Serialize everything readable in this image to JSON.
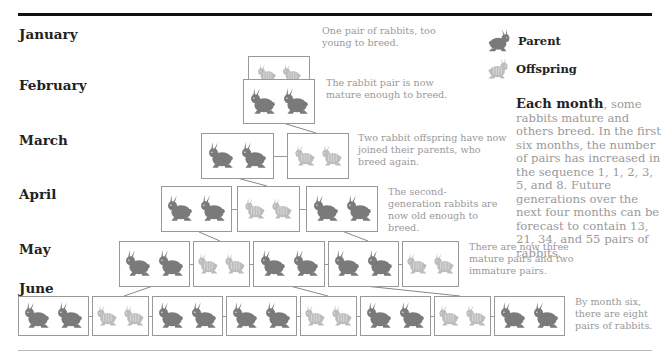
{
  "months": [
    {
      "name": "January",
      "y": 26
    },
    {
      "name": "February",
      "y": 77
    },
    {
      "name": "March",
      "y": 132
    },
    {
      "name": "April",
      "y": 186
    },
    {
      "name": "May",
      "y": 241
    },
    {
      "name": "June",
      "y": 280
    }
  ],
  "rows": [
    {
      "top": 56,
      "h": 36,
      "boxes": [
        {
          "x": 248,
          "w": 62,
          "type": "offspring"
        }
      ]
    },
    {
      "top": 79,
      "h": 45,
      "boxes": [
        {
          "x": 243,
          "w": 72,
          "type": "parent"
        }
      ]
    },
    {
      "top": 133,
      "h": 46,
      "boxes": [
        {
          "x": 201,
          "w": 73,
          "type": "parent"
        },
        {
          "x": 287,
          "w": 62,
          "type": "offspring"
        }
      ]
    },
    {
      "top": 186,
      "h": 46,
      "boxes": [
        {
          "x": 161,
          "w": 71,
          "type": "parent"
        },
        {
          "x": 237,
          "w": 63,
          "type": "offspring"
        },
        {
          "x": 306,
          "w": 72,
          "type": "parent"
        }
      ]
    },
    {
      "top": 241,
      "h": 46,
      "boxes": [
        {
          "x": 119,
          "w": 71,
          "type": "parent"
        },
        {
          "x": 193,
          "w": 57,
          "type": "offspring"
        },
        {
          "x": 253,
          "w": 72,
          "type": "parent"
        },
        {
          "x": 328,
          "w": 71,
          "type": "parent"
        },
        {
          "x": 402,
          "w": 57,
          "type": "offspring"
        }
      ]
    },
    {
      "top": 296,
      "h": 40,
      "boxes": [
        {
          "x": 18,
          "w": 71,
          "type": "parent"
        },
        {
          "x": 92,
          "w": 57,
          "type": "offspring"
        },
        {
          "x": 152,
          "w": 71,
          "type": "parent"
        },
        {
          "x": 226,
          "w": 71,
          "type": "parent"
        },
        {
          "x": 300,
          "w": 57,
          "type": "offspring"
        },
        {
          "x": 360,
          "w": 71,
          "type": "parent"
        },
        {
          "x": 434,
          "w": 57,
          "type": "offspring"
        },
        {
          "x": 494,
          "w": 71,
          "type": "parent"
        }
      ]
    }
  ],
  "links": [
    [
      283,
      123,
      316,
      133
    ],
    [
      237,
      178,
      267,
      186
    ],
    [
      199,
      232,
      220,
      241
    ],
    [
      342,
      231,
      368,
      241
    ],
    [
      153,
      286,
      124,
      296
    ],
    [
      290,
      286,
      328,
      296
    ],
    [
      365,
      286,
      460,
      296
    ]
  ],
  "notes": [
    {
      "x": 322,
      "y": 25,
      "w": 130,
      "text": "One pair of rabbits, too young to breed."
    },
    {
      "x": 326,
      "y": 77,
      "w": 130,
      "text": "The rabbit pair is now mature enough to breed."
    },
    {
      "x": 358,
      "y": 132,
      "w": 150,
      "text": "Two rabbit offspring have now joined their parents, who breed again."
    },
    {
      "x": 388,
      "y": 186,
      "w": 110,
      "text": "The second-generation rabbits are now old enough to breed."
    },
    {
      "x": 469,
      "y": 241,
      "w": 110,
      "text": "There are now three mature pairs and two immature pairs."
    },
    {
      "x": 575,
      "y": 296,
      "w": 90,
      "text": "By month six, there are eight pairs of rabbits."
    }
  ],
  "legend": {
    "parent": "Parent",
    "offspring": "Offspring"
  },
  "side": {
    "lead": "Each month",
    "body": ", some rabbits mature and others breed. In the first six months, the number of pairs has increased in the sequence 1, 1, 2, 3, 5, and 8. Future generations over the next four months can be forecast to contain 13, 21, 34, and 55 pairs of rabbits."
  },
  "colors": {
    "parent": "#7a7a7a",
    "offspring": "#bdbdbd",
    "box_border": "#999999"
  }
}
